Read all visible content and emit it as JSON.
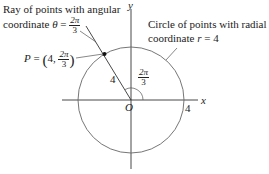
{
  "annotations": {
    "ray_label_line1": "Ray of points with angular",
    "ray_label_line2_prefix": "coordinate ",
    "ray_symbol": "θ",
    "equals": " = ",
    "ray_angle_num": "2π",
    "ray_angle_den": "3",
    "circle_label_line1": "Circle of points with radial",
    "circle_label_line2_prefix": "coordinate ",
    "circle_symbol": "r",
    "circle_value": " = 4",
    "point_label_prefix": "P",
    "point_r": "4,",
    "point_theta_num": "2π",
    "point_theta_den": "3"
  },
  "axes": {
    "x_label": "x",
    "y_label": "y",
    "origin_label": "O",
    "x_intercept_label": "4"
  },
  "segment_length_label": "4",
  "angle_label_num": "2π",
  "angle_label_den": "3",
  "colors": {
    "axis": "#333333",
    "circle": "#666666",
    "text": "#222222"
  },
  "geometry": {
    "radius": 4,
    "theta": "2π/3",
    "point": "P = (4, 2π/3)"
  }
}
